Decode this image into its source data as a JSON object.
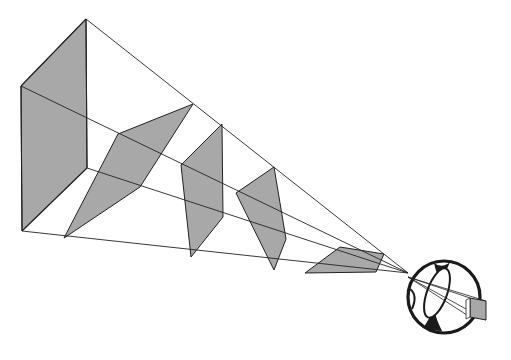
{
  "diagram": {
    "title": "",
    "width": 511,
    "height": 360,
    "colors": {
      "background": "#ffffff",
      "panel_fill": "#a8a8a8",
      "line": "#222222",
      "eye_outline": "#1a1a1a",
      "image_fill": "#a8a8a8"
    },
    "vertex": [
      408,
      273
    ],
    "rays": [
      [
        [
          86,
          19
        ],
        [
          408,
          273
        ]
      ],
      [
        [
          21,
          86
        ],
        [
          408,
          273
        ]
      ],
      [
        [
          87,
          168
        ],
        [
          408,
          273
        ]
      ],
      [
        [
          22,
          231
        ],
        [
          408,
          273
        ]
      ]
    ],
    "box_edges": [
      [
        [
          86,
          19
        ],
        [
          21,
          86
        ]
      ],
      [
        [
          21,
          86
        ],
        [
          22,
          231
        ]
      ],
      [
        [
          86,
          19
        ],
        [
          87,
          168
        ]
      ],
      [
        [
          87,
          168
        ],
        [
          22,
          231
        ]
      ]
    ],
    "panels": [
      {
        "name": "panel-1",
        "points": [
          [
            86,
            19
          ],
          [
            21,
            86
          ],
          [
            22,
            231
          ],
          [
            87,
            168
          ]
        ]
      },
      {
        "name": "panel-2",
        "points": [
          [
            193,
            104
          ],
          [
            118,
            134
          ],
          [
            64,
            238
          ],
          [
            140,
            187
          ]
        ]
      },
      {
        "name": "panel-3",
        "points": [
          [
            222,
            124
          ],
          [
            181,
            165
          ],
          [
            191,
            257
          ],
          [
            223,
            217
          ]
        ]
      },
      {
        "name": "panel-4",
        "points": [
          [
            274,
            167
          ],
          [
            236,
            193
          ],
          [
            274,
            270
          ],
          [
            286,
            239
          ]
        ]
      },
      {
        "name": "panel-5",
        "points": [
          [
            384,
            254
          ],
          [
            340,
            247
          ],
          [
            305,
            273
          ],
          [
            376,
            272
          ]
        ]
      }
    ],
    "eye": {
      "cx": 444,
      "cy": 297,
      "r": 36,
      "lens": {
        "cx": 437,
        "cy": 293,
        "rx": 10,
        "ry": 26,
        "rotate": 20
      }
    },
    "projected_image": {
      "points": [
        [
          470,
          298
        ],
        [
          486,
          301
        ],
        [
          486,
          320
        ],
        [
          470,
          317
        ]
      ]
    }
  }
}
